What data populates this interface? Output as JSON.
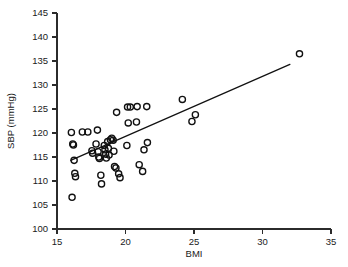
{
  "chart_data": {
    "type": "scatter",
    "title": "",
    "xlabel": "BMI",
    "ylabel": "SBP (mmHg)",
    "xlim": [
      15,
      35
    ],
    "ylim": [
      100,
      145
    ],
    "xticks": [
      15,
      20,
      25,
      30,
      35
    ],
    "xtick_labels": [
      "15",
      "20",
      "25",
      "30",
      "35"
    ],
    "yticks": [
      100,
      105,
      110,
      115,
      120,
      125,
      130,
      135,
      140,
      145
    ],
    "ytick_labels": [
      "100",
      "105",
      "110",
      "115",
      "120",
      "125",
      "130",
      "135",
      "140",
      "145"
    ],
    "grid": false,
    "legend": null,
    "marker": "open-circle",
    "marker_color": "#111111",
    "points": [
      {
        "x": 16.05,
        "y": 120.1
      },
      {
        "x": 16.15,
        "y": 117.7
      },
      {
        "x": 16.2,
        "y": 117.5
      },
      {
        "x": 16.25,
        "y": 114.3
      },
      {
        "x": 16.3,
        "y": 111.6
      },
      {
        "x": 16.35,
        "y": 110.9
      },
      {
        "x": 16.1,
        "y": 106.6
      },
      {
        "x": 16.85,
        "y": 120.2
      },
      {
        "x": 17.25,
        "y": 120.2
      },
      {
        "x": 17.55,
        "y": 116.3
      },
      {
        "x": 17.6,
        "y": 115.8
      },
      {
        "x": 17.85,
        "y": 117.7
      },
      {
        "x": 17.95,
        "y": 120.6
      },
      {
        "x": 18.0,
        "y": 116.1
      },
      {
        "x": 18.05,
        "y": 115.0
      },
      {
        "x": 18.1,
        "y": 114.7
      },
      {
        "x": 18.2,
        "y": 111.2
      },
      {
        "x": 18.25,
        "y": 109.4
      },
      {
        "x": 18.45,
        "y": 117.4
      },
      {
        "x": 18.5,
        "y": 116.5
      },
      {
        "x": 18.55,
        "y": 115.6
      },
      {
        "x": 18.6,
        "y": 114.8
      },
      {
        "x": 18.7,
        "y": 118.2
      },
      {
        "x": 18.75,
        "y": 116.8
      },
      {
        "x": 18.8,
        "y": 115.4
      },
      {
        "x": 18.9,
        "y": 118.6
      },
      {
        "x": 19.0,
        "y": 118.9
      },
      {
        "x": 19.1,
        "y": 118.5
      },
      {
        "x": 19.15,
        "y": 116.2
      },
      {
        "x": 19.2,
        "y": 113.0
      },
      {
        "x": 19.3,
        "y": 112.7
      },
      {
        "x": 19.35,
        "y": 124.3
      },
      {
        "x": 19.5,
        "y": 111.5
      },
      {
        "x": 19.6,
        "y": 110.7
      },
      {
        "x": 20.15,
        "y": 125.4
      },
      {
        "x": 20.35,
        "y": 125.4
      },
      {
        "x": 20.2,
        "y": 122.1
      },
      {
        "x": 20.1,
        "y": 117.4
      },
      {
        "x": 20.8,
        "y": 122.3
      },
      {
        "x": 20.85,
        "y": 125.5
      },
      {
        "x": 21.0,
        "y": 113.4
      },
      {
        "x": 21.25,
        "y": 112.0
      },
      {
        "x": 21.55,
        "y": 125.5
      },
      {
        "x": 21.6,
        "y": 118.0
      },
      {
        "x": 21.35,
        "y": 116.5
      },
      {
        "x": 24.15,
        "y": 127.0
      },
      {
        "x": 24.85,
        "y": 122.4
      },
      {
        "x": 25.1,
        "y": 123.8
      },
      {
        "x": 32.7,
        "y": 136.5
      }
    ],
    "fit_line": {
      "x1": 16.0,
      "y1": 114.3,
      "x2": 32.0,
      "y2": 134.3
    }
  }
}
